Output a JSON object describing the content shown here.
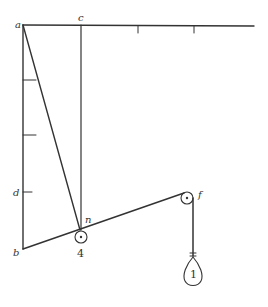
{
  "diagram": {
    "type": "mechanics-pulley-diagram",
    "line_color": "#333333",
    "labels": {
      "a": "a",
      "c": "c",
      "d": "d",
      "b": "b",
      "n": "n",
      "f": "f"
    },
    "weights": {
      "pulley_n_weight": "4",
      "hanging_weight": "1"
    },
    "points": {
      "a": [
        23,
        25
      ],
      "c": [
        81,
        25
      ],
      "b": [
        23,
        249
      ],
      "n": [
        80,
        230
      ],
      "f": [
        187,
        198
      ]
    },
    "top_beam_ticks_x": [
      138,
      194
    ],
    "left_post_ticks_y": [
      80,
      135,
      192
    ]
  }
}
